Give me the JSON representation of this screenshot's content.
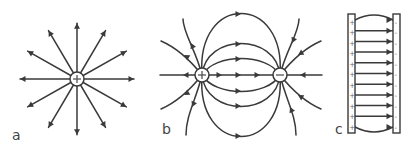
{
  "figure": {
    "panels": [
      {
        "id": "a",
        "label": "a",
        "description": "Radial field lines from a positive point charge",
        "charge_sign": "+",
        "line_count": 12
      },
      {
        "id": "b",
        "label": "b",
        "description": "Field lines between a positive and a negative charge (dipole)",
        "charges": [
          "+",
          "-"
        ]
      },
      {
        "id": "c",
        "label": "c",
        "description": "Uniform field between two oppositely charged parallel plates",
        "left_plate_sign": "+",
        "right_plate_sign": "-",
        "arrow_count": 11
      }
    ],
    "colors": {
      "ink": "#3a3a3a",
      "background": "#ffffff"
    }
  }
}
